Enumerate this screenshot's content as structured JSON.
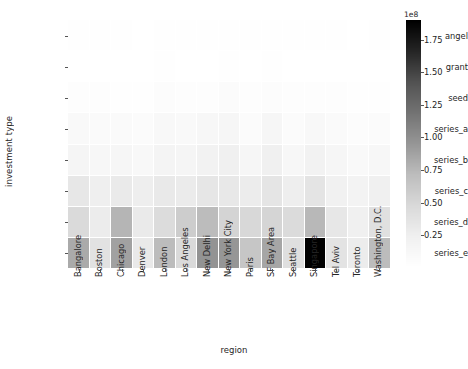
{
  "chart_data": {
    "type": "heatmap",
    "title": "",
    "xlabel": "region",
    "ylabel": "investment type",
    "x_categories": [
      "Bangalore",
      "Boston",
      "Chicago",
      "Denver",
      "London",
      "Los Angeles",
      "New Delhi",
      "New York City",
      "Paris",
      "SF Bay Area",
      "Seattle",
      "Singapore",
      "Tel Aviv",
      "Toronto",
      "Washington, D.C."
    ],
    "y_categories": [
      "angel",
      "grant",
      "seed",
      "series_a",
      "series_b",
      "series_c",
      "series_d",
      "series_e"
    ],
    "colormap": "Greys",
    "colorbar": {
      "offset_label": "1e8",
      "offset_value": 100000000,
      "ticks": [
        0.25,
        0.5,
        0.75,
        1.0,
        1.25,
        1.5,
        1.75
      ],
      "tick_labels": [
        "0.25",
        "0.50",
        "0.75",
        "1.00",
        "1.25",
        "1.50",
        "1.75"
      ],
      "vmin": 0,
      "vmax": 190000000,
      "position": "right"
    },
    "grid": true,
    "values": [
      [
        1200000,
        900000,
        1000000,
        700000,
        1500000,
        1300000,
        1600000,
        2100000,
        800000,
        1700000,
        900000,
        1100000,
        1000000,
        600000,
        900000
      ],
      [
        400000,
        600000,
        500000,
        300000,
        900000,
        500000,
        400000,
        900000,
        700000,
        800000,
        400000,
        300000,
        600000,
        300000,
        500000
      ],
      [
        3200000,
        2600000,
        2300000,
        1900000,
        4100000,
        3400000,
        3800000,
        5600000,
        2500000,
        5200000,
        2400000,
        3100000,
        2900000,
        1700000,
        2200000
      ],
      [
        9000000,
        7500000,
        7800000,
        5600000,
        11000000,
        9500000,
        12500000,
        15000000,
        7000000,
        14000000,
        6800000,
        10500000,
        8200000,
        5200000,
        6500000
      ],
      [
        16000000,
        13000000,
        15000000,
        11000000,
        18000000,
        16500000,
        21000000,
        24000000,
        13500000,
        23000000,
        12500000,
        20000000,
        14000000,
        9500000,
        12000000
      ],
      [
        33000000,
        25000000,
        30000000,
        26000000,
        31000000,
        29000000,
        34000000,
        32000000,
        28000000,
        35000000,
        26000000,
        36000000,
        22000000,
        19000000,
        24000000
      ],
      [
        46000000,
        28000000,
        76000000,
        30000000,
        44000000,
        58000000,
        72000000,
        52000000,
        48000000,
        51000000,
        45000000,
        74000000,
        33000000,
        24000000,
        40000000
      ],
      [
        83000000,
        38000000,
        88000000,
        31000000,
        72000000,
        46000000,
        97000000,
        95000000,
        64000000,
        85000000,
        41000000,
        190000000,
        37000000,
        28000000,
        72000000
      ]
    ]
  },
  "axes": {
    "x_label_text": "region",
    "y_label_text": "investment type"
  },
  "colorbar_offset_text": "1e8"
}
